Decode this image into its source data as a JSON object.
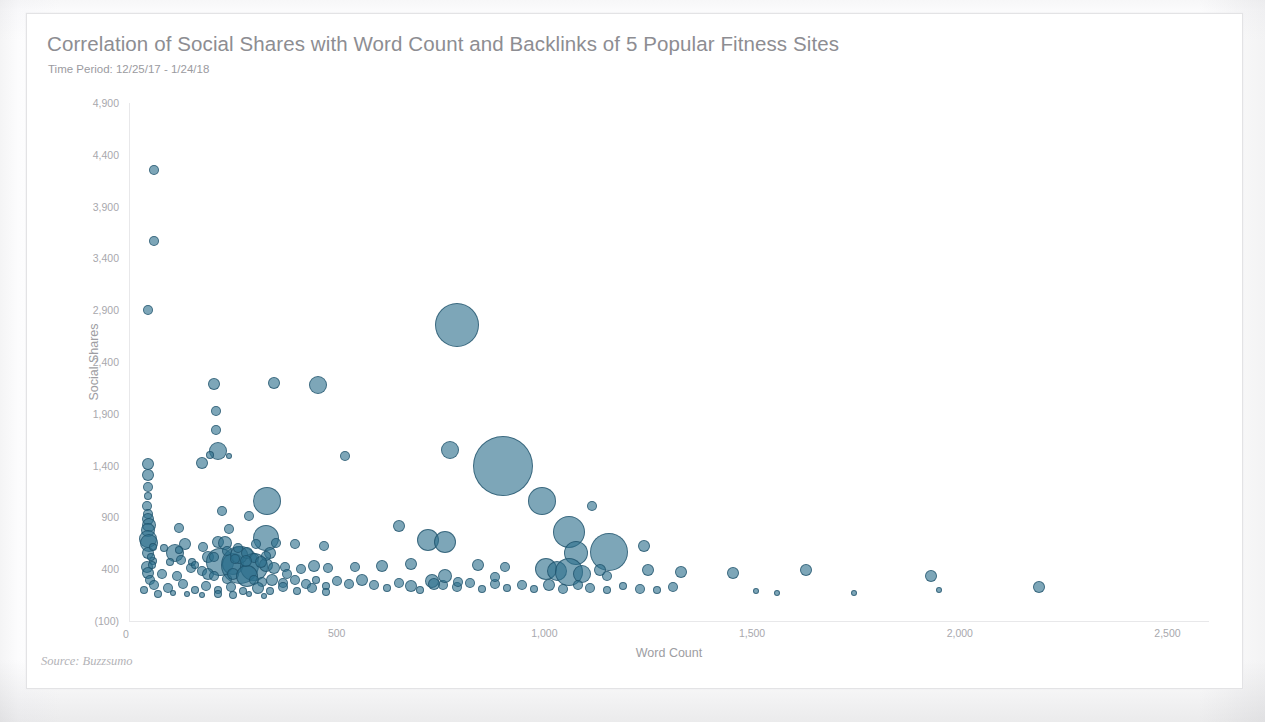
{
  "chart_data": {
    "type": "scatter",
    "title": "Correlation of Social Shares with Word Count and Backlinks of 5 Popular Fitness Sites",
    "subtitle": "Time Period: 12/25/17 - 1/24/18",
    "xlabel": "Word Count",
    "ylabel": "Social Shares",
    "source": "Source: Buzzsumo",
    "origin_label": "0",
    "grid": false,
    "legend": "none",
    "bubble_size_encodes": "Backlinks",
    "xlim": [
      0,
      2600
    ],
    "ylim": [
      -100,
      4900
    ],
    "xticks": [
      0,
      500,
      1000,
      1500,
      2000,
      2500
    ],
    "xtick_labels": [
      "0",
      "500",
      "1,000",
      "1,500",
      "2,000",
      "2,500"
    ],
    "yticks": [
      -100,
      400,
      900,
      1400,
      1900,
      2400,
      2900,
      3400,
      3900,
      4400,
      4900
    ],
    "ytick_labels": [
      "(100)",
      "400",
      "900",
      "1,400",
      "1,900",
      "2,400",
      "2,900",
      "3,400",
      "3,900",
      "4,400",
      "4,900"
    ],
    "marker_color": "#2d708c",
    "marker_edge_color": "#1c4e66",
    "marker_opacity": 0.62,
    "points": [
      {
        "x": 60,
        "y": 4250,
        "r": 5
      },
      {
        "x": 60,
        "y": 3570,
        "r": 5
      },
      {
        "x": 45,
        "y": 2900,
        "r": 5
      },
      {
        "x": 205,
        "y": 2185,
        "r": 6
      },
      {
        "x": 350,
        "y": 2195,
        "r": 6
      },
      {
        "x": 455,
        "y": 2175,
        "r": 9
      },
      {
        "x": 210,
        "y": 1930,
        "r": 5
      },
      {
        "x": 790,
        "y": 2760,
        "r": 22
      },
      {
        "x": 210,
        "y": 1745,
        "r": 5
      },
      {
        "x": 215,
        "y": 1540,
        "r": 9
      },
      {
        "x": 196,
        "y": 1500,
        "r": 4
      },
      {
        "x": 240,
        "y": 1490,
        "r": 3
      },
      {
        "x": 520,
        "y": 1490,
        "r": 5
      },
      {
        "x": 772,
        "y": 1550,
        "r": 9
      },
      {
        "x": 900,
        "y": 1400,
        "r": 30
      },
      {
        "x": 45,
        "y": 1420,
        "r": 6
      },
      {
        "x": 175,
        "y": 1425,
        "r": 6
      },
      {
        "x": 45,
        "y": 1310,
        "r": 6
      },
      {
        "x": 45,
        "y": 1190,
        "r": 5
      },
      {
        "x": 46,
        "y": 1110,
        "r": 4
      },
      {
        "x": 995,
        "y": 1055,
        "r": 14
      },
      {
        "x": 333,
        "y": 1060,
        "r": 14
      },
      {
        "x": 1115,
        "y": 1010,
        "r": 5
      },
      {
        "x": 44,
        "y": 1010,
        "r": 5
      },
      {
        "x": 45,
        "y": 930,
        "r": 5
      },
      {
        "x": 225,
        "y": 960,
        "r": 5
      },
      {
        "x": 290,
        "y": 910,
        "r": 5
      },
      {
        "x": 46,
        "y": 880,
        "r": 6
      },
      {
        "x": 48,
        "y": 830,
        "r": 7
      },
      {
        "x": 46,
        "y": 780,
        "r": 7
      },
      {
        "x": 120,
        "y": 800,
        "r": 5
      },
      {
        "x": 240,
        "y": 790,
        "r": 5
      },
      {
        "x": 650,
        "y": 820,
        "r": 6
      },
      {
        "x": 1060,
        "y": 760,
        "r": 16
      },
      {
        "x": 45,
        "y": 690,
        "r": 9
      },
      {
        "x": 47,
        "y": 650,
        "r": 9
      },
      {
        "x": 135,
        "y": 640,
        "r": 6
      },
      {
        "x": 215,
        "y": 660,
        "r": 6
      },
      {
        "x": 232,
        "y": 650,
        "r": 7
      },
      {
        "x": 330,
        "y": 700,
        "r": 13
      },
      {
        "x": 305,
        "y": 640,
        "r": 5
      },
      {
        "x": 355,
        "y": 655,
        "r": 5
      },
      {
        "x": 400,
        "y": 640,
        "r": 5
      },
      {
        "x": 470,
        "y": 620,
        "r": 5
      },
      {
        "x": 720,
        "y": 680,
        "r": 11
      },
      {
        "x": 760,
        "y": 660,
        "r": 11
      },
      {
        "x": 1155,
        "y": 570,
        "r": 19
      },
      {
        "x": 1075,
        "y": 560,
        "r": 12
      },
      {
        "x": 1240,
        "y": 620,
        "r": 6
      },
      {
        "x": 45,
        "y": 560,
        "r": 6
      },
      {
        "x": 110,
        "y": 555,
        "r": 9
      },
      {
        "x": 190,
        "y": 520,
        "r": 6
      },
      {
        "x": 220,
        "y": 470,
        "r": 14
      },
      {
        "x": 250,
        "y": 455,
        "r": 11
      },
      {
        "x": 268,
        "y": 440,
        "r": 19
      },
      {
        "x": 300,
        "y": 420,
        "r": 14
      },
      {
        "x": 330,
        "y": 440,
        "r": 7
      },
      {
        "x": 350,
        "y": 415,
        "r": 6
      },
      {
        "x": 375,
        "y": 425,
        "r": 5
      },
      {
        "x": 415,
        "y": 405,
        "r": 5
      },
      {
        "x": 445,
        "y": 430,
        "r": 6
      },
      {
        "x": 480,
        "y": 415,
        "r": 5
      },
      {
        "x": 545,
        "y": 420,
        "r": 5
      },
      {
        "x": 610,
        "y": 430,
        "r": 6
      },
      {
        "x": 680,
        "y": 455,
        "r": 6
      },
      {
        "x": 840,
        "y": 440,
        "r": 6
      },
      {
        "x": 905,
        "y": 420,
        "r": 5
      },
      {
        "x": 1005,
        "y": 400,
        "r": 11
      },
      {
        "x": 1030,
        "y": 380,
        "r": 10
      },
      {
        "x": 1060,
        "y": 370,
        "r": 14
      },
      {
        "x": 1090,
        "y": 355,
        "r": 9
      },
      {
        "x": 1135,
        "y": 390,
        "r": 6
      },
      {
        "x": 1250,
        "y": 395,
        "r": 6
      },
      {
        "x": 1330,
        "y": 370,
        "r": 6
      },
      {
        "x": 1455,
        "y": 365,
        "r": 6
      },
      {
        "x": 1630,
        "y": 395,
        "r": 6
      },
      {
        "x": 1930,
        "y": 330,
        "r": 6
      },
      {
        "x": 2190,
        "y": 230,
        "r": 6
      },
      {
        "x": 44,
        "y": 420,
        "r": 6
      },
      {
        "x": 46,
        "y": 360,
        "r": 6
      },
      {
        "x": 50,
        "y": 300,
        "r": 5
      },
      {
        "x": 80,
        "y": 350,
        "r": 5
      },
      {
        "x": 115,
        "y": 330,
        "r": 5
      },
      {
        "x": 150,
        "y": 410,
        "r": 5
      },
      {
        "x": 175,
        "y": 385,
        "r": 5
      },
      {
        "x": 190,
        "y": 355,
        "r": 6
      },
      {
        "x": 205,
        "y": 330,
        "r": 5
      },
      {
        "x": 235,
        "y": 310,
        "r": 5
      },
      {
        "x": 250,
        "y": 350,
        "r": 6
      },
      {
        "x": 285,
        "y": 330,
        "r": 11
      },
      {
        "x": 300,
        "y": 300,
        "r": 5
      },
      {
        "x": 320,
        "y": 280,
        "r": 5
      },
      {
        "x": 345,
        "y": 300,
        "r": 6
      },
      {
        "x": 370,
        "y": 270,
        "r": 5
      },
      {
        "x": 400,
        "y": 295,
        "r": 5
      },
      {
        "x": 425,
        "y": 260,
        "r": 5
      },
      {
        "x": 450,
        "y": 300,
        "r": 4
      },
      {
        "x": 475,
        "y": 240,
        "r": 4
      },
      {
        "x": 500,
        "y": 285,
        "r": 5
      },
      {
        "x": 530,
        "y": 255,
        "r": 5
      },
      {
        "x": 560,
        "y": 300,
        "r": 6
      },
      {
        "x": 590,
        "y": 250,
        "r": 5
      },
      {
        "x": 620,
        "y": 215,
        "r": 4
      },
      {
        "x": 650,
        "y": 270,
        "r": 5
      },
      {
        "x": 680,
        "y": 240,
        "r": 6
      },
      {
        "x": 700,
        "y": 200,
        "r": 4
      },
      {
        "x": 730,
        "y": 290,
        "r": 7
      },
      {
        "x": 755,
        "y": 250,
        "r": 5
      },
      {
        "x": 790,
        "y": 225,
        "r": 5
      },
      {
        "x": 820,
        "y": 270,
        "r": 5
      },
      {
        "x": 850,
        "y": 210,
        "r": 4
      },
      {
        "x": 880,
        "y": 255,
        "r": 5
      },
      {
        "x": 910,
        "y": 215,
        "r": 4
      },
      {
        "x": 945,
        "y": 250,
        "r": 5
      },
      {
        "x": 975,
        "y": 205,
        "r": 4
      },
      {
        "x": 1010,
        "y": 245,
        "r": 6
      },
      {
        "x": 1045,
        "y": 210,
        "r": 5
      },
      {
        "x": 1080,
        "y": 250,
        "r": 5
      },
      {
        "x": 1110,
        "y": 215,
        "r": 5
      },
      {
        "x": 1150,
        "y": 200,
        "r": 4
      },
      {
        "x": 1190,
        "y": 235,
        "r": 4
      },
      {
        "x": 1230,
        "y": 205,
        "r": 5
      },
      {
        "x": 1270,
        "y": 195,
        "r": 4
      },
      {
        "x": 1310,
        "y": 230,
        "r": 5
      },
      {
        "x": 1510,
        "y": 185,
        "r": 3
      },
      {
        "x": 1560,
        "y": 175,
        "r": 3
      },
      {
        "x": 1745,
        "y": 175,
        "r": 3
      },
      {
        "x": 1950,
        "y": 195,
        "r": 3
      },
      {
        "x": 60,
        "y": 250,
        "r": 5
      },
      {
        "x": 95,
        "y": 215,
        "r": 5
      },
      {
        "x": 130,
        "y": 255,
        "r": 5
      },
      {
        "x": 160,
        "y": 200,
        "r": 4
      },
      {
        "x": 185,
        "y": 240,
        "r": 5
      },
      {
        "x": 215,
        "y": 195,
        "r": 4
      },
      {
        "x": 245,
        "y": 230,
        "r": 5
      },
      {
        "x": 275,
        "y": 185,
        "r": 4
      },
      {
        "x": 310,
        "y": 220,
        "r": 6
      },
      {
        "x": 340,
        "y": 190,
        "r": 4
      },
      {
        "x": 370,
        "y": 225,
        "r": 5
      },
      {
        "x": 405,
        "y": 185,
        "r": 4
      },
      {
        "x": 440,
        "y": 215,
        "r": 5
      },
      {
        "x": 475,
        "y": 180,
        "r": 4
      },
      {
        "x": 35,
        "y": 200,
        "r": 4
      },
      {
        "x": 70,
        "y": 165,
        "r": 4
      },
      {
        "x": 105,
        "y": 175,
        "r": 3
      },
      {
        "x": 140,
        "y": 160,
        "r": 3
      },
      {
        "x": 175,
        "y": 150,
        "r": 3
      },
      {
        "x": 215,
        "y": 165,
        "r": 4
      },
      {
        "x": 250,
        "y": 150,
        "r": 4
      },
      {
        "x": 290,
        "y": 160,
        "r": 3
      },
      {
        "x": 325,
        "y": 145,
        "r": 3
      },
      {
        "x": 205,
        "y": 520,
        "r": 5
      },
      {
        "x": 178,
        "y": 610,
        "r": 5
      },
      {
        "x": 265,
        "y": 540,
        "r": 9
      },
      {
        "x": 283,
        "y": 560,
        "r": 6
      },
      {
        "x": 262,
        "y": 600,
        "r": 5
      },
      {
        "x": 235,
        "y": 575,
        "r": 5
      },
      {
        "x": 340,
        "y": 560,
        "r": 6
      },
      {
        "x": 330,
        "y": 530,
        "r": 5
      },
      {
        "x": 300,
        "y": 505,
        "r": 5
      },
      {
        "x": 282,
        "y": 480,
        "r": 6
      },
      {
        "x": 318,
        "y": 470,
        "r": 6
      },
      {
        "x": 255,
        "y": 500,
        "r": 5
      },
      {
        "x": 380,
        "y": 350,
        "r": 5
      },
      {
        "x": 58,
        "y": 480,
        "r": 4
      },
      {
        "x": 56,
        "y": 440,
        "r": 4
      },
      {
        "x": 52,
        "y": 520,
        "r": 4
      },
      {
        "x": 152,
        "y": 470,
        "r": 4
      },
      {
        "x": 160,
        "y": 440,
        "r": 4
      },
      {
        "x": 98,
        "y": 470,
        "r": 4
      },
      {
        "x": 125,
        "y": 490,
        "r": 5
      },
      {
        "x": 85,
        "y": 600,
        "r": 4
      },
      {
        "x": 120,
        "y": 585,
        "r": 4
      },
      {
        "x": 58,
        "y": 610,
        "r": 4
      },
      {
        "x": 760,
        "y": 330,
        "r": 7
      },
      {
        "x": 735,
        "y": 255,
        "r": 6
      },
      {
        "x": 792,
        "y": 280,
        "r": 5
      },
      {
        "x": 880,
        "y": 320,
        "r": 5
      },
      {
        "x": 1150,
        "y": 330,
        "r": 5
      }
    ]
  }
}
